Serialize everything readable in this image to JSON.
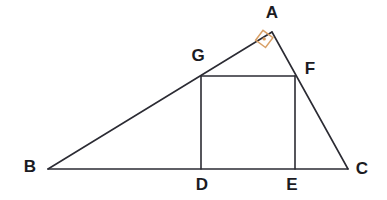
{
  "figure": {
    "background_color": "#ffffff",
    "stroke_color": "#2b2b33",
    "angle_marker_color": "#d9a066",
    "width": 387,
    "height": 200
  },
  "labels": {
    "a": "A",
    "b": "B",
    "c": "C",
    "d": "D",
    "e": "E",
    "f": "F",
    "g": "G"
  },
  "points": {
    "A": {
      "x": 272,
      "y": 32
    },
    "B": {
      "x": 48,
      "y": 169
    },
    "C": {
      "x": 348,
      "y": 169
    },
    "D": {
      "x": 201,
      "y": 169
    },
    "E": {
      "x": 295,
      "y": 169
    },
    "F": {
      "x": 295,
      "y": 76
    },
    "G": {
      "x": 201,
      "y": 76
    }
  },
  "label_positions": {
    "A": {
      "x": 272,
      "y": 14
    },
    "B": {
      "x": 30,
      "y": 168
    },
    "C": {
      "x": 362,
      "y": 170
    },
    "D": {
      "x": 202,
      "y": 186
    },
    "E": {
      "x": 292,
      "y": 186
    },
    "F": {
      "x": 310,
      "y": 70
    },
    "G": {
      "x": 198,
      "y": 57
    }
  },
  "segments": [
    {
      "name": "side-BA",
      "from": "B",
      "to": "A"
    },
    {
      "name": "side-AC",
      "from": "A",
      "to": "C"
    },
    {
      "name": "side-BC",
      "from": "B",
      "to": "C"
    },
    {
      "name": "square-top-GF",
      "from": "G",
      "to": "F"
    },
    {
      "name": "square-left-GD",
      "from": "G",
      "to": "D"
    },
    {
      "name": "square-right-FE",
      "from": "F",
      "to": "E"
    }
  ],
  "angle_marker": {
    "name": "right-angle-at-A",
    "vertex": "A",
    "symbol": "right-angle",
    "points": "265.5,47.5 255.6,40.2 263.0,30.3 272.9,37.6",
    "dot": {
      "x": 264.2,
      "y": 38.9,
      "r": 1.6
    }
  }
}
